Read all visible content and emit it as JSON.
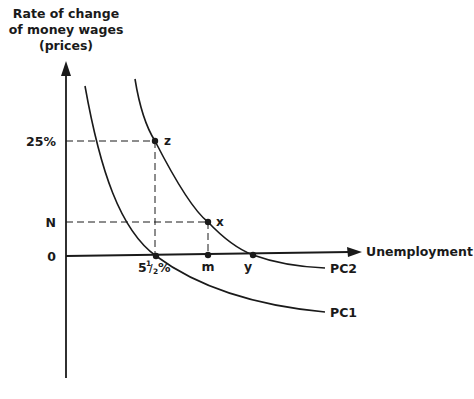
{
  "diagram": {
    "type": "phillips-curve",
    "y_axis_label_lines": [
      "Rate of change",
      "of money wages",
      "(prices)"
    ],
    "x_axis_label": "Unemployment",
    "y_ticks": {
      "high": "25%",
      "mid": "N",
      "zero": "0"
    },
    "x_ticks": {
      "natural_rate": "5½%",
      "natural_rate_main": "5",
      "natural_rate_num": "1",
      "natural_rate_den": "2",
      "natural_rate_pct": "%",
      "m": "m",
      "y": "y"
    },
    "points": {
      "z": "z",
      "x": "x"
    },
    "curves": {
      "pc1": "PC1",
      "pc2": "PC2"
    },
    "colors": {
      "ink": "#1a1a1a",
      "background": "#ffffff"
    }
  }
}
